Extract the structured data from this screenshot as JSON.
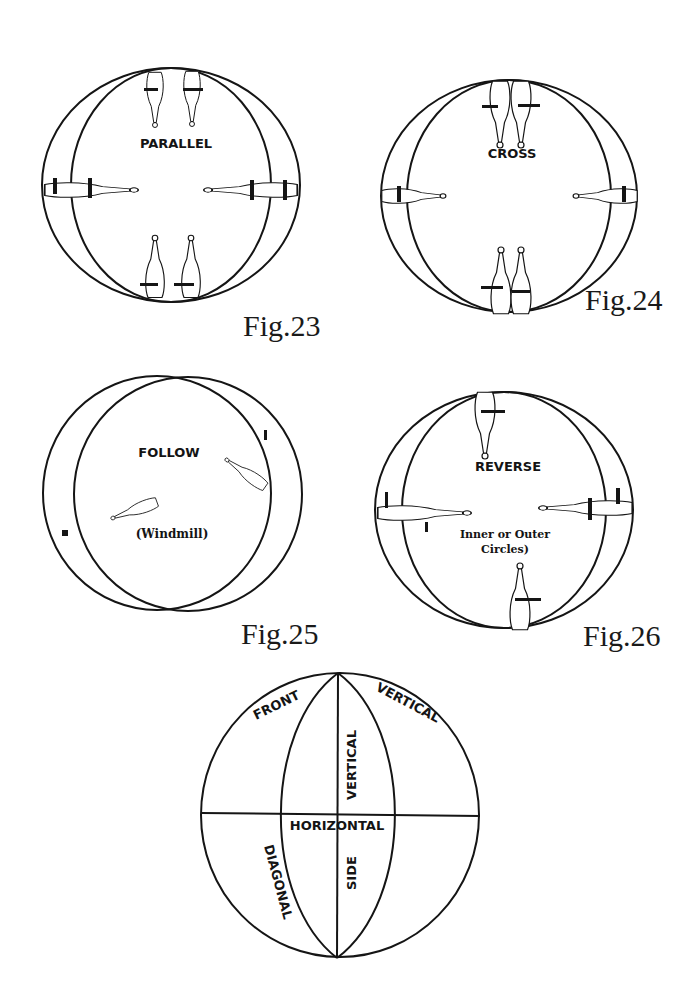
{
  "figures": [
    {
      "id": "fig23",
      "caption": "Fig.23",
      "label": "PARALLEL"
    },
    {
      "id": "fig24",
      "caption": "Fig.24",
      "label": "CROSS"
    },
    {
      "id": "fig25",
      "caption": "Fig.25",
      "label": "FOLLOW",
      "sublabel": "(Windmill)"
    },
    {
      "id": "fig26",
      "caption": "Fig.26",
      "label": "REVERSE",
      "sublabel_line1": "Inner or Outer",
      "sublabel_line2": "Circles)"
    }
  ],
  "planes_diagram": {
    "front": "FRONT",
    "vertical_outer": "VERTICAL",
    "vertical_inner": "VERTICAL",
    "horizontal": "HORIZONTAL",
    "diagonal": "DIAGONAL",
    "side": "SIDE"
  },
  "colors": {
    "ink": "#151515",
    "paper": "#ffffff"
  }
}
